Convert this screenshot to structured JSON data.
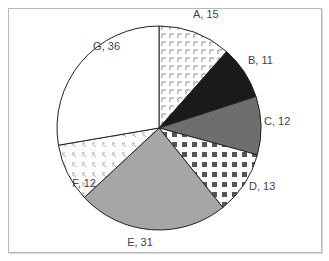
{
  "chart_data": {
    "type": "pie",
    "title": "",
    "categories": [
      "A",
      "B",
      "C",
      "D",
      "E",
      "F",
      "G"
    ],
    "values": [
      15,
      11,
      12,
      13,
      31,
      12,
      36
    ],
    "labels": [
      "A, 15",
      "B, 11",
      "C, 12",
      "D, 13",
      "E, 31",
      "F, 12",
      "G, 36"
    ],
    "fills": [
      {
        "pattern": "corner-marks",
        "color": "#888888",
        "bg": "#ffffff"
      },
      {
        "pattern": "solid",
        "color": "#1a1a1a"
      },
      {
        "pattern": "solid",
        "color": "#6e6e6e"
      },
      {
        "pattern": "square-dots",
        "color": "#555555",
        "bg": "#ffffff"
      },
      {
        "pattern": "solid",
        "color": "#a6a6a6"
      },
      {
        "pattern": "small-marks",
        "color": "#999999",
        "bg": "#ffffff"
      },
      {
        "pattern": "solid",
        "color": "#ffffff"
      }
    ],
    "start_angle_deg": 0,
    "direction": "clockwise",
    "legend": "none",
    "data_labels": "outside"
  }
}
